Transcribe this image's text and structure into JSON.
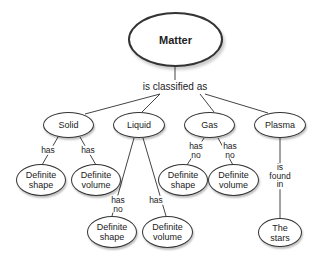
{
  "diagram": {
    "type": "concept-map",
    "root": {
      "label": "Matter"
    },
    "root_link": "is classified as",
    "categories": [
      {
        "label": "Solid",
        "children": [
          {
            "link": "has",
            "label": "Definite\nshape"
          },
          {
            "link": "has",
            "label": "Definite\nvolume"
          }
        ]
      },
      {
        "label": "Liquid",
        "children": [
          {
            "link": "has\nno",
            "label": "Definite\nshape"
          },
          {
            "link": "has",
            "label": "Definite\nvolume"
          }
        ]
      },
      {
        "label": "Gas",
        "children": [
          {
            "link": "has\nno",
            "label": "Definite\nshape"
          },
          {
            "link": "has\nno",
            "label": "Definite\nvolume"
          }
        ]
      },
      {
        "label": "Plasma",
        "children": [
          {
            "link": "is\nfound\nin",
            "label": "The\nstars"
          }
        ]
      }
    ]
  }
}
